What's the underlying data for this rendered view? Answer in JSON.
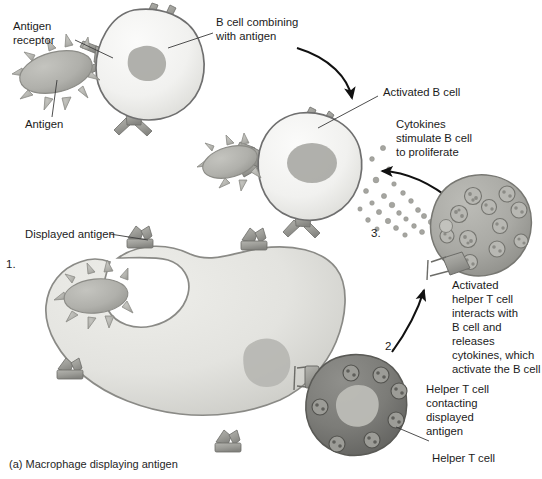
{
  "figure": {
    "caption": "(a) Macrophage displaying antigen",
    "steps": {
      "one": "1.",
      "two": "2.",
      "three": "3."
    }
  },
  "labels": {
    "antigen_receptor": {
      "line1": "Antigen",
      "line2": "receptor"
    },
    "antigen": "Antigen",
    "b_cell_combining": {
      "line1": "B cell combining",
      "line2": "with antigen"
    },
    "activated_b_cell": "Activated B cell",
    "cytokines_stimulate": {
      "line1": "Cytokines",
      "line2": "stimulate B cell",
      "line3": "to proliferate"
    },
    "activated_helper_t": {
      "line1": "Activated",
      "line2": "helper T cell",
      "line3": "interacts with",
      "line4": "B cell and",
      "line5": "releases",
      "line6": "cytokines, which",
      "line7": "activate the B cell"
    },
    "helper_t_contacting": {
      "line1": "Helper T cell",
      "line2": "contacting",
      "line3": "displayed",
      "line4": "antigen"
    },
    "helper_t_cell": "Helper T cell",
    "displayed_antigen": "Displayed antigen"
  },
  "colors": {
    "background": "#ffffff",
    "b_cell_fill": "#f2f2f0",
    "b_cell_stroke": "#6f6f6f",
    "b_cell_nucleus": "#a9a9a5",
    "macrophage_fill": "#e2e2de",
    "macrophage_stroke": "#8a8a86",
    "macrophage_nucleus": "#b6b6b1",
    "activated_t_fill": "#a8a8a3",
    "activated_t_stroke": "#777772",
    "helper_t_fill": "#7d7d79",
    "helper_t_stroke": "#5a5a56",
    "helper_t_nucleus": "#bdbdb8",
    "antigen_fill": "#b0b0ab",
    "antigen_stroke": "#8b8b86",
    "receptor_fill": "#9d9d98",
    "receptor_stroke": "#6c6c68",
    "cytokine_dot": "#a5a5a0",
    "text": "#1b1b1b",
    "leader_line": "#3a3a3a",
    "arrow": "#111111"
  },
  "elements": {
    "cells": [
      {
        "name": "b-cell-resting",
        "type": "b-cell",
        "stage": "combining with antigen"
      },
      {
        "name": "b-cell-activated",
        "type": "b-cell",
        "stage": "activated"
      },
      {
        "name": "macrophage",
        "type": "macrophage",
        "stage": "displaying antigen"
      },
      {
        "name": "helper-t-cell-activated",
        "type": "helper-t-cell",
        "stage": "activated, releasing cytokines"
      },
      {
        "name": "helper-t-cell-contacting",
        "type": "helper-t-cell",
        "stage": "contacting displayed antigen"
      }
    ],
    "antigen_count": 3,
    "cytokine_dot_count": 26
  }
}
